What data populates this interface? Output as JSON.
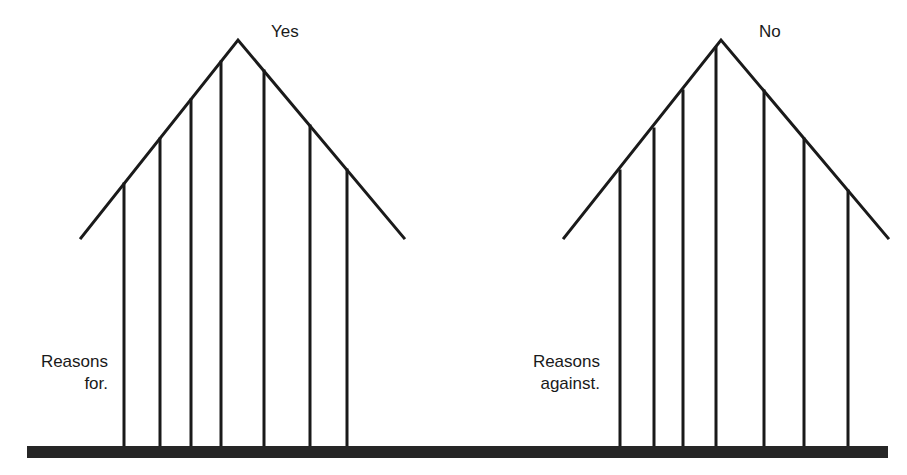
{
  "diagram": {
    "type": "two-roof comparison (pros vs cons)",
    "colors": {
      "line": "#1a1a1a",
      "base": "#262626",
      "background": "#ffffff"
    },
    "left_roof": {
      "title": "Yes",
      "label_line1": "Reasons",
      "label_line2": "for.",
      "apex": [
        238,
        40
      ],
      "eaves": [
        [
          81,
          238
        ],
        [
          404,
          238
        ]
      ],
      "pole_count": 7
    },
    "right_roof": {
      "title": "No",
      "label_line1": "Reasons",
      "label_line2": "against.",
      "apex": [
        721,
        40
      ],
      "eaves": [
        [
          564,
          238
        ],
        [
          888,
          238
        ]
      ],
      "pole_count": 7
    },
    "base": {
      "label": "ground line"
    }
  }
}
